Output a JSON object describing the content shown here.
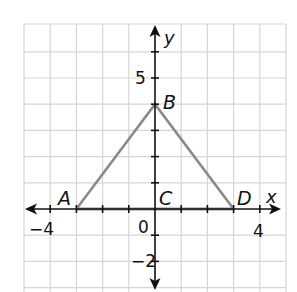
{
  "diagram": {
    "type": "coordinate-plane",
    "axes": {
      "x_label": "x",
      "y_label": "y",
      "x_range": [
        -5,
        5
      ],
      "y_range": [
        -3,
        7
      ],
      "tick_labels": {
        "x_neg4": "−4",
        "x_pos4": "4",
        "origin": "0",
        "y_pos5": "5",
        "y_neg2": "−2"
      }
    },
    "grid": {
      "color": "#d6d6d6",
      "spacing_units": 1
    },
    "triangle": {
      "color": "#8a8a8a",
      "vertices": [
        {
          "label": "A",
          "x": -3,
          "y": 0
        },
        {
          "label": "B",
          "x": 0,
          "y": 4
        },
        {
          "label": "D",
          "x": 3,
          "y": 0
        }
      ]
    },
    "points": {
      "A": "A",
      "B": "B",
      "C": "C",
      "D": "D"
    }
  }
}
